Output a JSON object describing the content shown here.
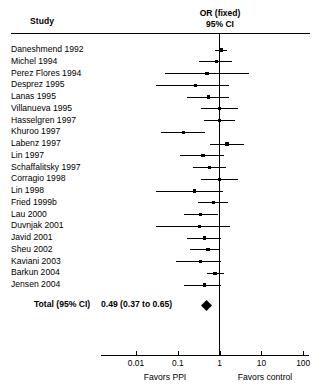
{
  "header": {
    "study_col": "Study",
    "or_line1": "OR (fixed)",
    "or_line2": "95% CI"
  },
  "total": {
    "label": "Total (95% CI)",
    "value": "0.49 (0.37 to 0.65)"
  },
  "axis": {
    "ticks": [
      "0.01",
      "0.1",
      "1",
      "10",
      "100"
    ],
    "favors_left": "Favors PPI",
    "favors_right": "Favors control"
  },
  "chart_data": {
    "type": "scatter",
    "title": "OR (fixed) 95% CI",
    "subtitle": "Forest plot of odds ratios",
    "xlabel": "Odds ratio (log scale)",
    "ylabel": "Study",
    "xscale": "log",
    "xlim": [
      0.01,
      100
    ],
    "xticks": [
      0.01,
      0.1,
      1,
      10,
      100
    ],
    "grid": false,
    "legend": "none",
    "reference_line": 1,
    "effect_measure": "OR (fixed)",
    "model": "fixed effect",
    "left_favors": "Favors PPI",
    "right_favors": "Favors control",
    "categories": [
      "Daneshmend 1992",
      "Michel 1994",
      "Perez Flores 1994",
      "Desprez 1995",
      "Lanas 1995",
      "Villanueva 1995",
      "Hasselgren 1997",
      "Khuroo 1997",
      "Labenz 1997",
      "Lin 1997",
      "Schaffalitsky 1997",
      "Corragio 1998",
      "Lin 1998",
      "Fried 1999b",
      "Lau 2000",
      "Duvnjak 2001",
      "Javid 2001",
      "Sheu 2002",
      "Kaviani 2003",
      "Barkun 2004",
      "Jensen 2004"
    ],
    "studies": [
      {
        "name": "Daneshmend 1992",
        "or": 1.1,
        "ci_low": 0.76,
        "ci_high": 1.5,
        "weight": 3.1
      },
      {
        "name": "Michel 1994",
        "or": 0.83,
        "ci_low": 0.33,
        "ci_high": 2.0,
        "weight": 2.2
      },
      {
        "name": "Perez Flores 1994",
        "or": 0.5,
        "ci_low": 0.05,
        "ci_high": 5.1,
        "weight": 1.4
      },
      {
        "name": "Desprez 1995",
        "or": 0.26,
        "ci_low": 0.03,
        "ci_high": 1.7,
        "weight": 1.4
      },
      {
        "name": "Lanas 1995",
        "or": 0.54,
        "ci_low": 0.17,
        "ci_high": 1.7,
        "weight": 1.9
      },
      {
        "name": "Villanueva 1995",
        "or": 1.0,
        "ci_low": 0.35,
        "ci_high": 2.8,
        "weight": 2.3
      },
      {
        "name": "Hasselgren 1997",
        "or": 1.0,
        "ci_low": 0.42,
        "ci_high": 2.4,
        "weight": 2.6
      },
      {
        "name": "Khuroo 1997",
        "or": 0.14,
        "ci_low": 0.04,
        "ci_high": 0.46,
        "weight": 2.0
      },
      {
        "name": "Labenz 1997",
        "or": 1.5,
        "ci_low": 0.6,
        "ci_high": 3.8,
        "weight": 2.4
      },
      {
        "name": "Lin 1997",
        "or": 0.4,
        "ci_low": 0.11,
        "ci_high": 1.3,
        "weight": 2.4
      },
      {
        "name": "Schaffalitsky 1997",
        "or": 0.57,
        "ci_low": 0.23,
        "ci_high": 1.4,
        "weight": 2.2
      },
      {
        "name": "Corragio 1998",
        "or": 1.0,
        "ci_low": 0.35,
        "ci_high": 2.8,
        "weight": 2.1
      },
      {
        "name": "Lin 1998",
        "or": 0.25,
        "ci_low": 0.03,
        "ci_high": 1.2,
        "weight": 2.1
      },
      {
        "name": "Fried 1999b",
        "or": 0.71,
        "ci_low": 0.3,
        "ci_high": 1.6,
        "weight": 2.3
      },
      {
        "name": "Lau 2000",
        "or": 0.35,
        "ci_low": 0.14,
        "ci_high": 0.9,
        "weight": 2.8
      },
      {
        "name": "Duvnjak 2001",
        "or": 0.33,
        "ci_low": 0.03,
        "ci_high": 1.8,
        "weight": 2.1
      },
      {
        "name": "Javid 2001",
        "or": 0.44,
        "ci_low": 0.17,
        "ci_high": 1.1,
        "weight": 2.7
      },
      {
        "name": "Sheu 2002",
        "or": 0.53,
        "ci_low": 0.2,
        "ci_high": 1.0,
        "weight": 2.4
      },
      {
        "name": "Kaviani 2003",
        "or": 0.35,
        "ci_low": 0.09,
        "ci_high": 1.1,
        "weight": 2.4
      },
      {
        "name": "Barkun 2004",
        "or": 0.78,
        "ci_low": 0.5,
        "ci_high": 1.3,
        "weight": 2.6
      },
      {
        "name": "Jensen 2004",
        "or": 0.44,
        "ci_low": 0.14,
        "ci_high": 1.1,
        "weight": 2.4
      }
    ],
    "summary": {
      "label": "Total (95% CI)",
      "or": 0.49,
      "ci_low": 0.37,
      "ci_high": 0.65,
      "text": "0.49 (0.37 to 0.65)"
    }
  }
}
